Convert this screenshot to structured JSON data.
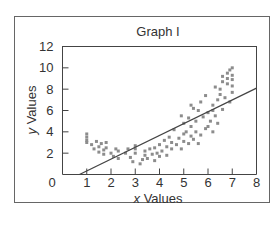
{
  "chart_data": {
    "type": "scatter",
    "title": "Graph I",
    "xlabel": "x Values",
    "ylabel": "y Values",
    "xlim": [
      0,
      8
    ],
    "ylim": [
      0,
      12
    ],
    "xticks": [
      0,
      1,
      2,
      3,
      4,
      5,
      6,
      7,
      8
    ],
    "yticks": [
      2,
      4,
      6,
      8,
      10,
      12
    ],
    "ytick_zero_label": "0",
    "grid": false,
    "legend": null,
    "marker_color": "#8c8c8c",
    "line_color": "#444444",
    "series": [
      {
        "name": "observations",
        "points": [
          [
            1.0,
            3.8
          ],
          [
            1.0,
            3.5
          ],
          [
            1.0,
            3.2
          ],
          [
            1.0,
            3.0
          ],
          [
            1.2,
            2.8
          ],
          [
            1.3,
            2.4
          ],
          [
            1.4,
            3.1
          ],
          [
            1.5,
            2.6
          ],
          [
            1.5,
            2.1
          ],
          [
            1.6,
            2.9
          ],
          [
            1.7,
            2.3
          ],
          [
            1.7,
            1.9
          ],
          [
            1.8,
            3.0
          ],
          [
            1.8,
            2.5
          ],
          [
            2.0,
            2.0
          ],
          [
            2.1,
            1.7
          ],
          [
            2.2,
            2.4
          ],
          [
            2.3,
            1.5
          ],
          [
            2.3,
            2.2
          ],
          [
            2.6,
            2.0
          ],
          [
            2.7,
            2.4
          ],
          [
            2.8,
            1.6
          ],
          [
            2.9,
            1.2
          ],
          [
            3.0,
            2.7
          ],
          [
            3.0,
            2.4
          ],
          [
            3.0,
            2.0
          ],
          [
            3.2,
            1.0
          ],
          [
            3.3,
            1.4
          ],
          [
            3.4,
            1.8
          ],
          [
            3.4,
            2.2
          ],
          [
            3.5,
            1.5
          ],
          [
            3.6,
            2.4
          ],
          [
            3.7,
            1.9
          ],
          [
            3.8,
            1.3
          ],
          [
            3.8,
            2.5
          ],
          [
            3.9,
            2.0
          ],
          [
            4.0,
            1.7
          ],
          [
            4.0,
            2.8
          ],
          [
            4.1,
            2.2
          ],
          [
            4.2,
            3.2
          ],
          [
            4.3,
            1.8
          ],
          [
            4.3,
            2.6
          ],
          [
            4.4,
            3.5
          ],
          [
            4.5,
            2.4
          ],
          [
            4.5,
            3.0
          ],
          [
            4.6,
            4.2
          ],
          [
            4.7,
            2.8
          ],
          [
            4.8,
            3.4
          ],
          [
            4.9,
            2.4
          ],
          [
            5.0,
            3.8
          ],
          [
            5.0,
            3.1
          ],
          [
            5.1,
            4.0
          ],
          [
            5.2,
            2.9
          ],
          [
            5.3,
            3.6
          ],
          [
            5.3,
            4.5
          ],
          [
            5.4,
            3.3
          ],
          [
            5.5,
            4.0
          ],
          [
            5.6,
            2.9
          ],
          [
            5.7,
            3.7
          ],
          [
            5.0,
            4.8
          ],
          [
            5.2,
            5.3
          ],
          [
            5.4,
            6.2
          ],
          [
            5.5,
            5.0
          ],
          [
            5.6,
            6.0
          ],
          [
            5.7,
            6.8
          ],
          [
            5.8,
            5.4
          ],
          [
            5.9,
            4.3
          ],
          [
            6.0,
            5.8
          ],
          [
            6.0,
            4.5
          ],
          [
            6.1,
            5.0
          ],
          [
            6.2,
            4.0
          ],
          [
            6.2,
            6.5
          ],
          [
            6.3,
            5.5
          ],
          [
            6.4,
            4.8
          ],
          [
            6.5,
            7.5
          ],
          [
            6.5,
            8.0
          ],
          [
            6.6,
            6.1
          ],
          [
            6.7,
            7.2
          ],
          [
            6.8,
            9.5
          ],
          [
            6.8,
            9.0
          ],
          [
            6.8,
            8.5
          ],
          [
            6.9,
            6.8
          ],
          [
            6.3,
            8.2
          ],
          [
            6.4,
            7.0
          ],
          [
            6.6,
            9.2
          ],
          [
            6.6,
            8.7
          ],
          [
            6.9,
            9.8
          ],
          [
            7.0,
            10.0
          ],
          [
            7.0,
            9.3
          ],
          [
            7.0,
            8.9
          ],
          [
            7.0,
            8.3
          ],
          [
            7.0,
            7.7
          ],
          [
            6.2,
            6.0
          ],
          [
            5.9,
            7.4
          ],
          [
            5.3,
            6.5
          ],
          [
            4.9,
            5.5
          ]
        ]
      }
    ],
    "trendline": {
      "type": "linear",
      "x1": 0.7,
      "y1": 0.0,
      "x2": 8.0,
      "y2": 8.1
    }
  }
}
